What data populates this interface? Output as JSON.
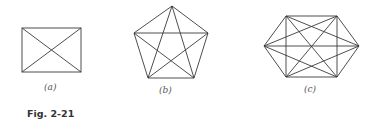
{
  "figure": {
    "caption": "Fig. 2-21",
    "panels": [
      {
        "label": "(a)",
        "name": "complete-graph-K4",
        "vertices": 4
      },
      {
        "label": "(b)",
        "name": "complete-graph-K5",
        "vertices": 5
      },
      {
        "label": "(c)",
        "name": "complete-graph-K6",
        "vertices": 6
      }
    ]
  },
  "colors": {
    "stroke": "#3a3a3a",
    "background": "#ffffff"
  }
}
